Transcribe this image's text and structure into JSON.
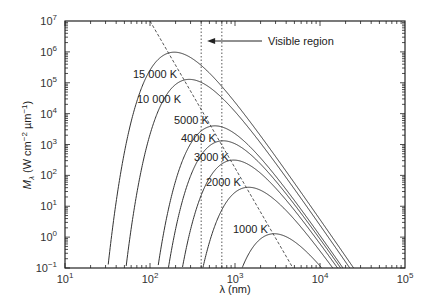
{
  "chart_data": {
    "type": "line",
    "title": "",
    "xlabel": "λ (nm)",
    "ylabel": "M_λ (W cm⁻² µm⁻¹)",
    "xscale": "log",
    "yscale": "log",
    "xlim": [
      10,
      100000
    ],
    "ylim": [
      0.1,
      10000000
    ],
    "x_ticks": [
      {
        "base": "10",
        "exp": "1"
      },
      {
        "base": "10",
        "exp": "2"
      },
      {
        "base": "10",
        "exp": "3"
      },
      {
        "base": "10",
        "exp": "4"
      },
      {
        "base": "10",
        "exp": "5"
      }
    ],
    "y_ticks": [
      {
        "base": "10",
        "exp": "−1"
      },
      {
        "base": "10",
        "exp": "0"
      },
      {
        "base": "10",
        "exp": "1"
      },
      {
        "base": "10",
        "exp": "2"
      },
      {
        "base": "10",
        "exp": "3"
      },
      {
        "base": "10",
        "exp": "4"
      },
      {
        "base": "10",
        "exp": "5"
      },
      {
        "base": "10",
        "exp": "6"
      },
      {
        "base": "10",
        "exp": "7"
      }
    ],
    "grid": false,
    "legend": null,
    "series": [
      {
        "name": "15 000 K",
        "temperature_K": 15000,
        "peak_nm": 193,
        "peak_value": 1000000,
        "label_x": 133,
        "label_y": 78
      },
      {
        "name": "10 000 K",
        "temperature_K": 10000,
        "peak_nm": 290,
        "peak_value": 130000,
        "label_x": 137,
        "label_y": 103
      },
      {
        "name": "5000 K",
        "temperature_K": 5000,
        "peak_nm": 580,
        "peak_value": 4000,
        "label_x": 174,
        "label_y": 124
      },
      {
        "name": "4000 K",
        "temperature_K": 4000,
        "peak_nm": 725,
        "peak_value": 1300,
        "label_x": 181,
        "label_y": 142
      },
      {
        "name": "3000 K",
        "temperature_K": 3000,
        "peak_nm": 966,
        "peak_value": 310,
        "label_x": 194,
        "label_y": 161
      },
      {
        "name": "2000 K",
        "temperature_K": 2000,
        "peak_nm": 1449,
        "peak_value": 41,
        "label_x": 206,
        "label_y": 186
      },
      {
        "name": "1000 K",
        "temperature_K": 1000,
        "peak_nm": 2898,
        "peak_value": 1.3,
        "label_x": 233,
        "label_y": 233
      }
    ],
    "annotations": [
      {
        "type": "dashed-line",
        "name": "Wien displacement locus",
        "from": {
          "x_nm": 100,
          "y": 10000000
        },
        "to": {
          "x_nm": 4800,
          "y": 0.1
        }
      },
      {
        "type": "dotted-vline",
        "x_nm": 400
      },
      {
        "type": "dotted-vline",
        "x_nm": 700
      },
      {
        "type": "arrow-text",
        "text": "Visible region",
        "arrow_to_nm": 470,
        "y": 3000000
      }
    ]
  }
}
